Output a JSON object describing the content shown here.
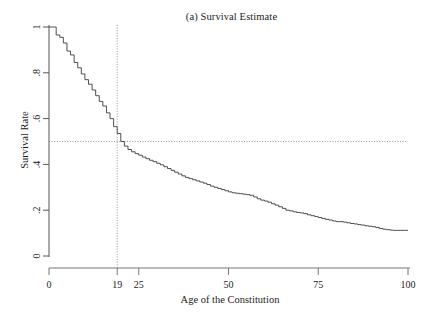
{
  "chart_data": {
    "type": "line",
    "title": "(a) Survival Estimate",
    "xlabel": "Age of the Constitution",
    "ylabel": "Survival Rate",
    "xlim": [
      0,
      100
    ],
    "ylim": [
      0,
      1
    ],
    "grid": false,
    "legend": "none",
    "step_style": "post",
    "xticks": [
      0,
      19,
      25,
      50,
      75,
      100
    ],
    "xtick_labels": [
      "0",
      "19",
      "25",
      "50",
      "75",
      "100"
    ],
    "yticks": [
      0,
      0.2,
      0.4,
      0.6,
      0.8,
      1
    ],
    "ytick_labels": [
      "0",
      ".2",
      ".4",
      ".6",
      ".8",
      "1"
    ],
    "annotations": [
      {
        "name": "median-survival-vertical-reference",
        "type": "vline",
        "x": 19,
        "style": "dotted",
        "color": "#8a8a8a"
      },
      {
        "name": "half-survival-horizontal-reference",
        "type": "hline",
        "y": 0.5,
        "style": "dotted",
        "color": "#8a8a8a"
      }
    ],
    "series": [
      {
        "name": "Survival Rate",
        "color": "#3c3c3c",
        "x": [
          0,
          1,
          2,
          3,
          4,
          5,
          6,
          7,
          8,
          9,
          10,
          11,
          12,
          13,
          14,
          15,
          16,
          17,
          18,
          19,
          20,
          21,
          22,
          23,
          24,
          25,
          26,
          27,
          28,
          29,
          30,
          31,
          32,
          33,
          34,
          35,
          36,
          37,
          38,
          39,
          40,
          41,
          42,
          43,
          44,
          45,
          46,
          47,
          48,
          49,
          50,
          51,
          52,
          53,
          54,
          55,
          56,
          57,
          58,
          59,
          60,
          61,
          62,
          63,
          64,
          65,
          66,
          67,
          68,
          69,
          70,
          71,
          72,
          73,
          74,
          75,
          76,
          77,
          78,
          79,
          80,
          81,
          82,
          83,
          84,
          85,
          86,
          87,
          88,
          89,
          90,
          91,
          92,
          93,
          94,
          95,
          96,
          97,
          98,
          99,
          100
        ],
        "y": [
          1.0,
          1.0,
          0.965,
          0.955,
          0.93,
          0.895,
          0.878,
          0.845,
          0.822,
          0.795,
          0.77,
          0.75,
          0.725,
          0.7,
          0.675,
          0.655,
          0.625,
          0.6,
          0.565,
          0.535,
          0.5,
          0.48,
          0.465,
          0.455,
          0.447,
          0.44,
          0.432,
          0.425,
          0.418,
          0.412,
          0.405,
          0.398,
          0.39,
          0.382,
          0.374,
          0.366,
          0.358,
          0.35,
          0.343,
          0.338,
          0.333,
          0.328,
          0.323,
          0.318,
          0.312,
          0.305,
          0.3,
          0.295,
          0.29,
          0.285,
          0.28,
          0.276,
          0.274,
          0.272,
          0.27,
          0.268,
          0.265,
          0.258,
          0.25,
          0.244,
          0.24,
          0.235,
          0.228,
          0.222,
          0.215,
          0.208,
          0.2,
          0.197,
          0.193,
          0.19,
          0.188,
          0.185,
          0.18,
          0.176,
          0.172,
          0.168,
          0.164,
          0.16,
          0.157,
          0.153,
          0.15,
          0.15,
          0.148,
          0.145,
          0.142,
          0.14,
          0.137,
          0.135,
          0.132,
          0.13,
          0.128,
          0.125,
          0.12,
          0.117,
          0.115,
          0.113,
          0.112,
          0.112,
          0.112,
          0.112,
          0.112
        ]
      }
    ]
  }
}
